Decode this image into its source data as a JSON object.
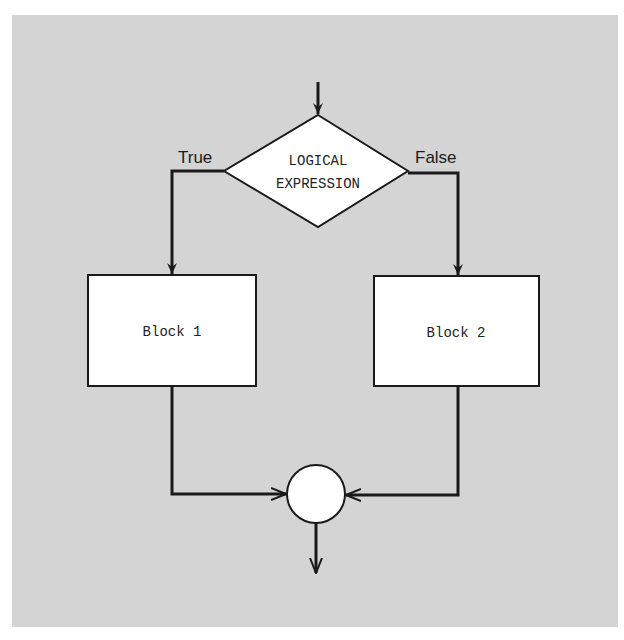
{
  "diagram": {
    "type": "flowchart",
    "decision": {
      "line1": "LOGICAL",
      "line2": "EXPRESSION"
    },
    "branches": {
      "true_label": "True",
      "false_label": "False"
    },
    "blocks": [
      {
        "label": "Block 1"
      },
      {
        "label": "Block 2"
      }
    ],
    "join": {
      "shape": "circle"
    },
    "colors": {
      "background": "#d4d4d4",
      "shape_fill": "#ffffff",
      "stroke": "#1a1a1a"
    }
  }
}
